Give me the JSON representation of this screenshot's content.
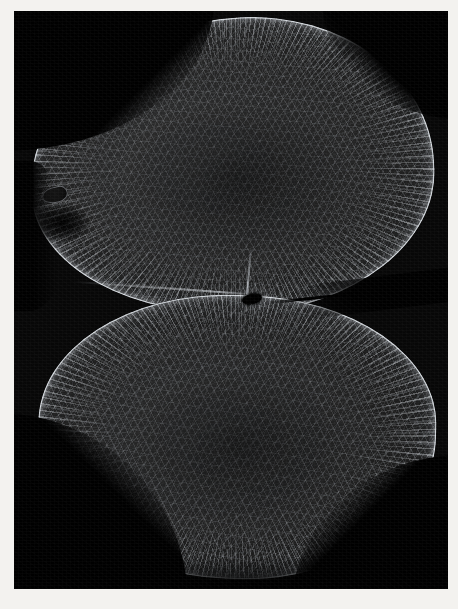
{
  "image": {
    "kind": "photomicrograph",
    "technique": "dark-field / myelin-stain cross-section",
    "subject": "spinal cord transverse section",
    "title": "",
    "caption": "",
    "background_color": "#f3f2ef",
    "field_color": "#070707",
    "tissue_color": "#222222",
    "rim_color": "#e8edf3",
    "canal_color": "#020202"
  },
  "frame": {
    "margin_left_px": 14,
    "margin_top_px": 11,
    "field_width_px": 434,
    "field_height_px": 578
  },
  "structures": [
    {
      "id": "lobe-upper",
      "label": "upper lobe",
      "interactable": false
    },
    {
      "id": "lobe-lower",
      "label": "lower lobe",
      "interactable": false
    },
    {
      "id": "central-canal",
      "label": "central canal",
      "interactable": false
    },
    {
      "id": "fissure-right",
      "label": "lateral fissure",
      "interactable": false
    },
    {
      "id": "raphe-left",
      "label": "median raphe",
      "interactable": false
    },
    {
      "id": "septum-dorsal",
      "label": "dorsal septum",
      "interactable": false
    },
    {
      "id": "left-spur",
      "label": "left marginal spur",
      "interactable": false
    },
    {
      "id": "pial-rim",
      "label": "pial surface rim",
      "interactable": false
    },
    {
      "id": "radial-fibers",
      "label": "radial fibre striations",
      "interactable": false
    }
  ],
  "annotations": {
    "scale_bar": "",
    "labels": []
  }
}
